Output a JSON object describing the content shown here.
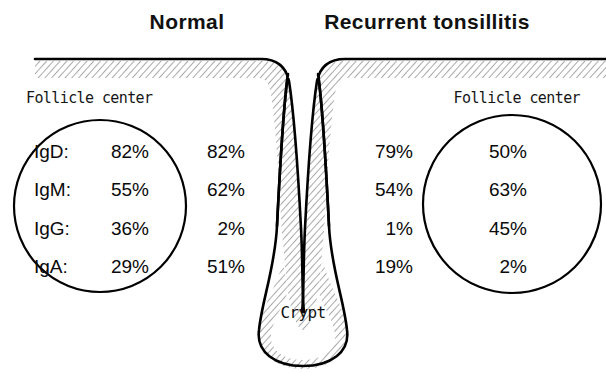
{
  "figure": {
    "panels": [
      {
        "id": "normal",
        "title": "Normal",
        "follicle_label": "Follicle center",
        "follicle_center_values": [
          "82%",
          "62%",
          "2%",
          "51%"
        ],
        "interfollicular_values": [
          "82%",
          "62%",
          "2%",
          "51%"
        ]
      },
      {
        "id": "recurrent-tonsillitis",
        "title": "Recurrent tonsillitis",
        "follicle_label": "Follicle center",
        "follicle_center_values": [
          "50%",
          "63%",
          "45%",
          "2%"
        ],
        "interfollicular_values": [
          "79%",
          "54%",
          "1%",
          "19%"
        ]
      }
    ],
    "isotype_labels": [
      "IgD:",
      "IgM:",
      "IgG:",
      "IgA:"
    ],
    "normal_follicle_values": [
      "82%",
      "55%",
      "36%",
      "29%"
    ],
    "normal_outer_values": [
      "82%",
      "62%",
      "2%",
      "51%"
    ],
    "tonsillitis_outer_values": [
      "79%",
      "54%",
      "1%",
      "19%"
    ],
    "tonsillitis_follicle_values": [
      "50%",
      "63%",
      "45%",
      "2%"
    ],
    "crypt_label": "Crypt",
    "colors": {
      "ink": "#000000",
      "background": "#ffffff",
      "hatch": "#8a8a8a"
    }
  }
}
